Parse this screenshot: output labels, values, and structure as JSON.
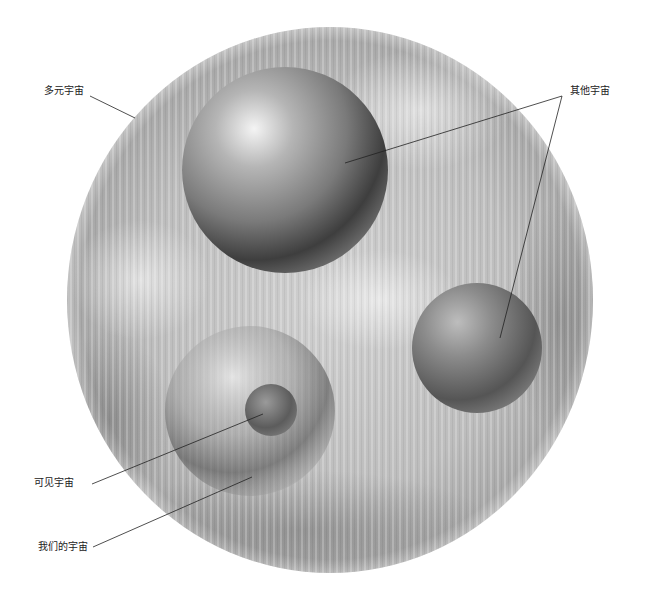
{
  "diagram": {
    "type": "multiverse-illustration",
    "labels": {
      "multiverse": "多元宇宙",
      "other_universes": "其他宇宙",
      "observable_universe": "可见宇宙",
      "our_universe": "我们的宇宙"
    },
    "colors": {
      "background": "#ffffff",
      "multiverse_light": "#d9d9d9",
      "multiverse_dark": "#a8a8a8",
      "sphere_highlight": "#f2f2f2",
      "sphere_shadow": "#3a3a3a",
      "leader_line": "#222222",
      "label_text": "#222222"
    }
  }
}
